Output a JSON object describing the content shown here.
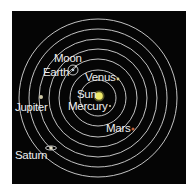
{
  "diagram": {
    "type": "solar-system-orbits",
    "colors": {
      "background": "#050505",
      "orbit": "#d8d8d8",
      "label": "#eeeeee",
      "sun": "#f0ea6a",
      "mars": "#c0603a",
      "planet": "#cfc9a8"
    },
    "center": {
      "label": "Sun"
    },
    "bodies": [
      {
        "name": "mercury",
        "label": "Mercury"
      },
      {
        "name": "venus",
        "label": "Venus"
      },
      {
        "name": "earth",
        "label": "Earth"
      },
      {
        "name": "moon",
        "label": "Moon"
      },
      {
        "name": "mars",
        "label": "Mars"
      },
      {
        "name": "jupiter",
        "label": "Jupiter"
      },
      {
        "name": "saturn",
        "label": "Saturn"
      }
    ],
    "orbit_count": 7
  }
}
